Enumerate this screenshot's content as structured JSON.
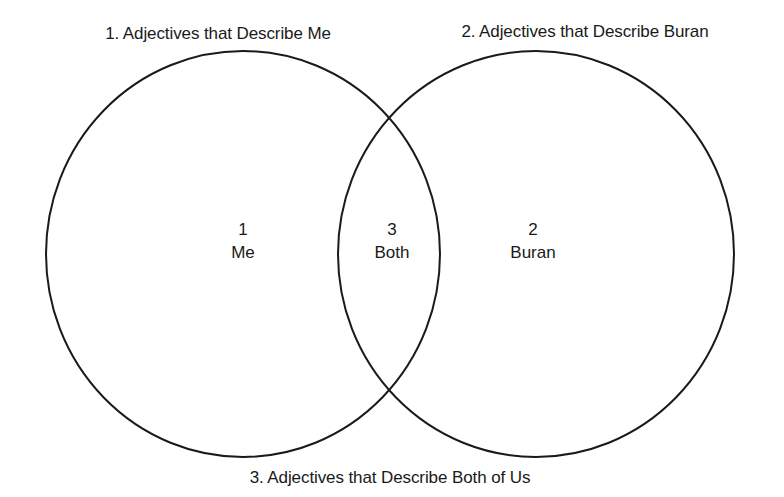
{
  "titles": {
    "set1": "1.  Adjectives that Describe Me",
    "set2": "2.  Adjectives that Describe Buran",
    "intersection": "3.  Adjectives that Describe Both of Us"
  },
  "regions": {
    "me": {
      "number": "1",
      "label": "Me"
    },
    "both": {
      "number": "3",
      "label": "Both"
    },
    "buran": {
      "number": "2",
      "label": "Buran"
    }
  },
  "colors": {
    "stroke": "#1a1a1a",
    "background": "#ffffff"
  }
}
